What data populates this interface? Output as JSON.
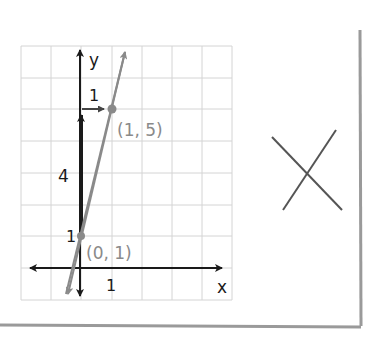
{
  "diagram": {
    "type": "coordinate-graph",
    "axes": {
      "x_label": "x",
      "y_label": "y"
    },
    "grid": {
      "columns": 7,
      "rows": 8,
      "cell_px": 31
    },
    "line": {
      "points": [
        [
          0,
          1
        ],
        [
          1,
          5
        ]
      ],
      "slope": 4,
      "intercept": 1,
      "color": "#8a8a8a"
    },
    "points": [
      {
        "label": "(0, 1)",
        "x": 0,
        "y": 1
      },
      {
        "label": "(1, 5)",
        "x": 1,
        "y": 5
      }
    ],
    "rise": {
      "label": "4",
      "value": 4
    },
    "run": {
      "label": "1",
      "value": 1
    },
    "tick_labels": {
      "y1": "1",
      "x1": "1"
    },
    "mark": {
      "symbol": "X",
      "meaning": "incorrect"
    },
    "colors": {
      "axis": "#1a1a1a",
      "grid": "#d4d4d4",
      "line": "#8a8a8a",
      "paper_shadow": "#9a9a9a"
    }
  }
}
